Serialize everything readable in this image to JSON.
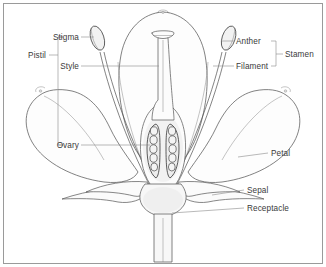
{
  "diagram": {
    "style": "line-drawing",
    "colors": {
      "background": "#ffffff",
      "frame": "#9a9a9a",
      "outline": "#585858",
      "leader": "#8a8a8a",
      "text": "#3a3a3a",
      "ovule_fill": "#f4f4f4",
      "locule_fill": "#ededed"
    }
  },
  "labels": {
    "pistil": "Pistil",
    "stigma": "Stigma",
    "style": "Style",
    "ovary": "Ovary",
    "anther": "Anther",
    "filament": "Filament",
    "stamen": "Stamen",
    "petal": "Petal",
    "sepal": "Sepal",
    "receptacle": "Receptacle"
  },
  "label_list": [
    {
      "id": "pistil",
      "text": "Pistil",
      "side": "left",
      "x": 31,
      "y": 55,
      "grouping": "bracket"
    },
    {
      "id": "stigma",
      "text": "Stigma",
      "side": "left",
      "x": 78,
      "y": 40,
      "grouping": "leader"
    },
    {
      "id": "style",
      "text": "Style",
      "side": "left",
      "x": 78,
      "y": 68,
      "grouping": "leader"
    },
    {
      "id": "ovary",
      "text": "Ovary",
      "side": "left",
      "x": 78,
      "y": 145,
      "grouping": "leader"
    },
    {
      "id": "anther",
      "text": "Anther",
      "side": "right",
      "x": 238,
      "y": 43,
      "grouping": "leader"
    },
    {
      "id": "filament",
      "text": "Filament",
      "side": "right",
      "x": 238,
      "y": 68,
      "grouping": "leader"
    },
    {
      "id": "stamen",
      "text": "Stamen",
      "side": "right",
      "x": 288,
      "y": 56,
      "grouping": "bracket"
    },
    {
      "id": "petal",
      "text": "Petal",
      "side": "right",
      "x": 272,
      "y": 156,
      "grouping": "leader"
    },
    {
      "id": "sepal",
      "text": "Sepal",
      "side": "right",
      "x": 248,
      "y": 192,
      "grouping": "leader"
    },
    {
      "id": "receptacle",
      "text": "Receptacle",
      "side": "right",
      "x": 248,
      "y": 210,
      "grouping": "leader"
    }
  ],
  "brackets": {
    "pistil": {
      "label": "Pistil",
      "covers": [
        "Stigma",
        "Style",
        "Ovary"
      ]
    },
    "stamen": {
      "label": "Stamen",
      "covers": [
        "Anther",
        "Filament"
      ]
    }
  },
  "structures": {
    "ovules_per_locule": 5,
    "locule_count": 2,
    "stamen_count": 2,
    "petal_count": 3,
    "sepal_count": 4
  }
}
